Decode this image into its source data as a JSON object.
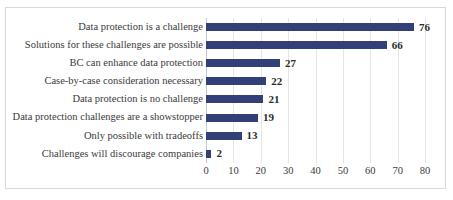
{
  "chart_data": {
    "type": "bar",
    "orientation": "horizontal",
    "title": "",
    "subtitle": "",
    "xlabel": "",
    "ylabel": "",
    "xlim": [
      0,
      80
    ],
    "xticks": [
      0,
      10,
      20,
      30,
      40,
      50,
      60,
      70,
      80
    ],
    "xtick_labels": [
      "0",
      "10",
      "20",
      "30",
      "40",
      "50",
      "60",
      "70",
      "80"
    ],
    "grid": "vertical",
    "legend": "none",
    "bar_color": "#334078",
    "gridline_color": "#e4e4e4",
    "categories": [
      "Data protection is a challenge",
      "Solutions for these challenges are possible",
      "BC can enhance data protection",
      "Case-by-case consideration necessary",
      "Data protection is no challenge",
      "Data protection challenges are a showstopper",
      "Only possible with tradeoffs",
      "Challenges will discourage companies"
    ],
    "values": [
      76,
      66,
      27,
      22,
      21,
      19,
      13,
      2
    ],
    "value_labels": [
      "76",
      "66",
      "27",
      "22",
      "21",
      "19",
      "13",
      "2"
    ]
  }
}
